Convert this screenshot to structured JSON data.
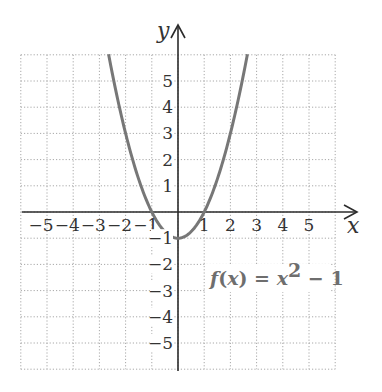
{
  "chart_data": {
    "type": "line",
    "title": "",
    "function_label": {
      "name": "f",
      "arg": "x",
      "text": "f(x) = x² − 1",
      "rhs_base": "x",
      "rhs_exp": "2",
      "rhs_rest": "− 1"
    },
    "xlabel": "x",
    "ylabel": "y",
    "xlim": [
      -6,
      6
    ],
    "ylim": [
      -6,
      6
    ],
    "grid": true,
    "x_ticks": [
      -5,
      -4,
      -3,
      -2,
      -1,
      1,
      2,
      3,
      4,
      5
    ],
    "x_tick_labels": [
      "−5",
      "−4",
      "−3",
      "−2",
      "−1",
      "1",
      "2",
      "3",
      "4",
      "5"
    ],
    "y_ticks": [
      5,
      4,
      3,
      2,
      1,
      -1,
      -2,
      -3,
      -4,
      -5
    ],
    "y_tick_labels": [
      "5",
      "4",
      "3",
      "2",
      "1",
      "−1",
      "−2",
      "−3",
      "−4",
      "−5"
    ],
    "series": [
      {
        "name": "f(x) = x^2 - 1",
        "equation": "x^2 - 1",
        "x": [
          -2.65,
          -2.5,
          -2,
          -1.5,
          -1,
          -0.5,
          0,
          0.5,
          1,
          1.5,
          2,
          2.5,
          2.65
        ],
        "y": [
          6.0,
          5.25,
          3,
          1.25,
          0,
          -0.75,
          -1,
          -0.75,
          0,
          1.25,
          3,
          5.25,
          6.0
        ],
        "color": "#777777"
      }
    ],
    "colors": {
      "axis": "#2b2b2b",
      "grid": "#a8a8a8",
      "curve": "#777777",
      "label": "#6e6e6e"
    }
  }
}
